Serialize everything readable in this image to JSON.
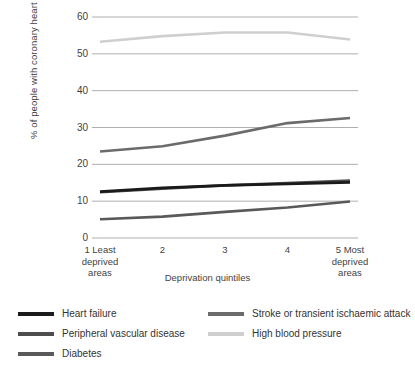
{
  "chart_data": {
    "type": "line",
    "title": "",
    "subtitle": "",
    "xlabel": "Deprivation quintiles",
    "ylabel": "% of people with coronary heart disease",
    "categories": [
      "1 Least\ndeprived\nareas",
      "2",
      "3",
      "4",
      "5 Most\ndeprived\nareas"
    ],
    "x": [
      1,
      2,
      3,
      4,
      5
    ],
    "ylim": [
      0,
      60
    ],
    "yticks": [
      0,
      10,
      20,
      30,
      40,
      50,
      60
    ],
    "grid": "horizontal",
    "legend_position": "bottom",
    "series": [
      {
        "name": "Heart failure",
        "color": "#1a1a1a",
        "values": [
          12.6,
          13.6,
          14.3,
          14.7,
          15.1
        ]
      },
      {
        "name": "Peripheral vascular disease",
        "color": "#4d4d4d",
        "values": [
          12.4,
          13.4,
          14.3,
          14.9,
          15.6
        ]
      },
      {
        "name": "Diabetes",
        "color": "#595959",
        "values": [
          5.1,
          5.8,
          7.1,
          8.3,
          9.9
        ]
      },
      {
        "name": "Stroke or transient ischaemic attack",
        "color": "#6b6b6b",
        "values": [
          23.5,
          24.9,
          27.8,
          31.2,
          32.6
        ]
      },
      {
        "name": "High blood pressure",
        "color": "#cfcfcf",
        "values": [
          53.3,
          54.8,
          55.8,
          55.8,
          53.9
        ]
      }
    ]
  },
  "axes": {
    "ytick_labels": [
      "60",
      "50",
      "40",
      "30",
      "20",
      "10",
      "0"
    ],
    "xtick_labels": [
      "1 Least\ndeprived\nareas",
      "2",
      "3",
      "4",
      "5 Most\ndeprived\nareas"
    ],
    "ylabel": "% of people with coronary heart disease",
    "xlabel": "Deprivation quintiles"
  },
  "legend": {
    "entries": [
      {
        "label": "Heart failure",
        "color": "#1a1a1a"
      },
      {
        "label": "Stroke or transient ischaemic attack",
        "color": "#6b6b6b"
      },
      {
        "label": "Peripheral vascular disease",
        "color": "#4d4d4d"
      },
      {
        "label": "High blood pressure",
        "color": "#cfcfcf"
      },
      {
        "label": "Diabetes",
        "color": "#595959"
      }
    ]
  },
  "style": {
    "grid_color": "#a6a6a6",
    "text_color": "#3f3f3f",
    "background": "#ffffff"
  }
}
